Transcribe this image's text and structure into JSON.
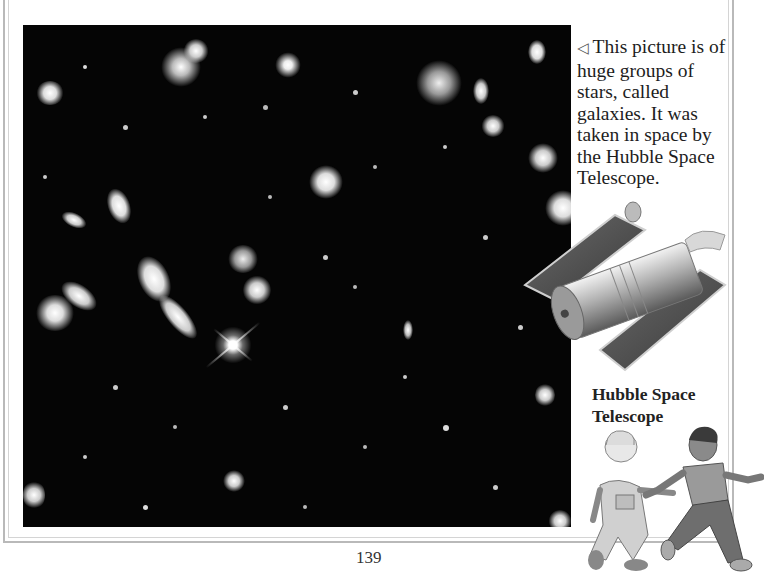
{
  "page": {
    "number": "139",
    "colors": {
      "background": "#ffffff",
      "border": "#b9b9b9",
      "photo_bg": "#050505",
      "text": "#1d1d1d"
    }
  },
  "photo": {
    "subject": "Hubble Deep Field galaxies",
    "icon": "galaxy-photo"
  },
  "caption": {
    "pointer_icon": "◁",
    "text": "This picture is of huge groups of stars, called galaxies. It was taken in space by the Hubble Space Telescope."
  },
  "telescope_label": {
    "line1": "Hubble Space",
    "line2": "Telescope"
  },
  "illustrations": {
    "telescope": "hubble-telescope-illustration",
    "children": "two-children-running-illustration"
  }
}
